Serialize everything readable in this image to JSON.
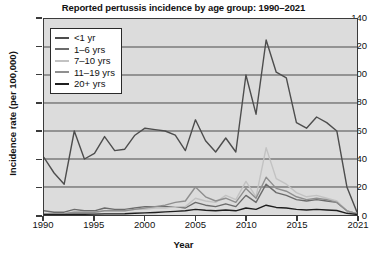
{
  "chart_data": {
    "type": "line",
    "title": "Reported pertussis incidence by age group: 1990–2021",
    "xlabel": "Year",
    "ylabel": "Incidence rate (per 100,000)",
    "xlim": [
      1990,
      2021
    ],
    "ylim": [
      0,
      140
    ],
    "yticks": [
      0,
      20,
      40,
      60,
      80,
      100,
      120,
      140
    ],
    "xticks": [
      1990,
      1995,
      2000,
      2005,
      2010,
      2015,
      2021
    ],
    "grid": true,
    "legend_position": "upper-left",
    "x": [
      1990,
      1991,
      1992,
      1993,
      1994,
      1995,
      1996,
      1997,
      1998,
      1999,
      2000,
      2001,
      2002,
      2003,
      2004,
      2005,
      2006,
      2007,
      2008,
      2009,
      2010,
      2011,
      2012,
      2013,
      2014,
      2015,
      2016,
      2017,
      2018,
      2019,
      2020,
      2021
    ],
    "series": [
      {
        "name": "<1 yr",
        "color": "#4d4d4d",
        "values": [
          41,
          30,
          22,
          60,
          40,
          44,
          56,
          46,
          47,
          57,
          62,
          61,
          60,
          57,
          46,
          68,
          53,
          45,
          55,
          45,
          100,
          72,
          125,
          102,
          98,
          66,
          62,
          70,
          66,
          60,
          20,
          2
        ]
      },
      {
        "name": "1–6 yrs",
        "color": "#6b6b6b",
        "values": [
          3,
          2,
          2,
          4,
          3,
          3,
          5,
          4,
          4,
          5,
          6,
          6,
          6,
          6,
          5,
          9,
          7,
          6,
          8,
          6,
          14,
          9,
          22,
          16,
          14,
          11,
          10,
          11,
          10,
          9,
          3,
          1
        ]
      },
      {
        "name": "7–10 yrs",
        "color": "#c2c2c2",
        "values": [
          1,
          1,
          1,
          2,
          2,
          2,
          3,
          3,
          3,
          4,
          4,
          5,
          5,
          6,
          6,
          12,
          10,
          9,
          14,
          11,
          24,
          13,
          48,
          26,
          22,
          16,
          13,
          14,
          12,
          10,
          3,
          1
        ]
      },
      {
        "name": "11–19 yrs",
        "color": "#8f8f8f",
        "values": [
          1,
          1,
          1,
          2,
          2,
          2,
          3,
          3,
          3,
          4,
          5,
          6,
          7,
          9,
          10,
          20,
          13,
          10,
          12,
          9,
          19,
          12,
          27,
          19,
          17,
          13,
          11,
          12,
          11,
          9,
          3,
          1
        ]
      },
      {
        "name": "20+ yrs",
        "color": "#1f1f1f",
        "values": [
          0.3,
          0.3,
          0.3,
          0.5,
          0.5,
          0.6,
          0.8,
          0.8,
          0.9,
          1.2,
          1.5,
          1.8,
          2.2,
          2.6,
          3,
          4,
          3.4,
          3,
          3.6,
          3,
          5,
          4,
          7,
          5.4,
          5,
          4,
          3.6,
          4,
          3.6,
          3.2,
          1.2,
          0.4
        ]
      }
    ]
  }
}
